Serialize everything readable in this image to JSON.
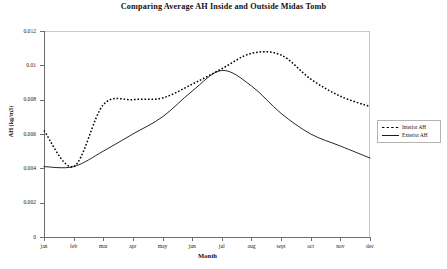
{
  "chart_data": {
    "type": "line",
    "title": "Comparing Average AH Inside and Outside Midas Tomb",
    "xlabel": "Month",
    "ylabel": "AH (kg/m3)",
    "categories": [
      "jan",
      "feb",
      "mar",
      "apr",
      "may",
      "jun",
      "jul",
      "aug",
      "sept",
      "oct",
      "nov",
      "dec"
    ],
    "ylim": [
      0,
      0.012
    ],
    "yticks": [
      0,
      0.002,
      0.004,
      0.006,
      0.008,
      0.01,
      0.012
    ],
    "ytick_labels": [
      "0",
      "0.002",
      "0.004",
      "0.006",
      "0.008",
      "0.01",
      "0.012"
    ],
    "grid": false,
    "legend_position": "right",
    "series": [
      {
        "name": "Interior AH",
        "style": "dotted",
        "color": "#000000",
        "values": [
          0.0062,
          0.0041,
          0.0077,
          0.008,
          0.0081,
          0.0089,
          0.0098,
          0.0107,
          0.0106,
          0.0092,
          0.0082,
          0.0076
        ]
      },
      {
        "name": "Exterior AH",
        "style": "solid",
        "color": "#000000",
        "values": [
          0.0041,
          0.0041,
          0.005,
          0.006,
          0.007,
          0.0085,
          0.0097,
          0.0088,
          0.0072,
          0.006,
          0.0053,
          0.0046
        ]
      }
    ]
  },
  "legend": {
    "items": [
      {
        "label": "Interior AH",
        "style": "dotted"
      },
      {
        "label": "Exterior AH",
        "style": "solid"
      }
    ]
  }
}
